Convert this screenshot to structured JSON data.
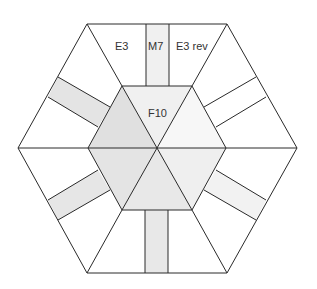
{
  "diagram": {
    "labels": {
      "e3": "E3",
      "m7": "M7",
      "e3_rev": "E3 rev",
      "f10": "F10"
    },
    "colors": {
      "line": "#2a2a2a",
      "background": "#ffffff",
      "tri_upper_left": "#e0e0e0",
      "tri_top": "#f0f0f0",
      "tri_upper_right": "#f7f7f7",
      "tri_lower_right": "#efefef",
      "tri_bottom": "#e8e8e8",
      "tri_lower_left": "#e4e4e4",
      "strip_shaded": "#e6e6e6",
      "strip_light": "#f2f2f2"
    }
  }
}
